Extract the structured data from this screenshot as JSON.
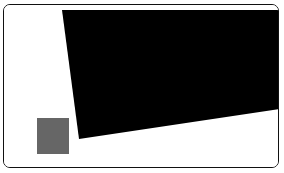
{
  "canvas": {
    "width": 284,
    "height": 173,
    "background_color": "#ffffff"
  },
  "card": {
    "name": "rounded-panel",
    "x": 3,
    "y": 4,
    "width": 276,
    "height": 164,
    "fill_color": "#ffffff",
    "border_color": "#111111",
    "border_width": 1,
    "corner_radius": 7
  },
  "shapes": {
    "black_region": {
      "label": "black-polygon",
      "fill_color": "#000000",
      "points": "58,5 275,5 275,104 75,134",
      "description": "large dark quadrilateral occupying upper right of panel"
    },
    "gray_square": {
      "label": "gray-square",
      "fill_color": "#666666",
      "x": 33,
      "y": 113,
      "width": 32,
      "height": 36
    }
  },
  "labels": {
    "panel_title": "",
    "caption": ""
  }
}
